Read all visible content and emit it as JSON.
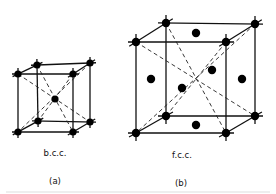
{
  "figures": [
    {
      "id": "a",
      "structure_label": "b.c.c.",
      "panel_label": "(a)",
      "lattice": "body-centered cubic",
      "corners": {
        "ftl": [
          18,
          74
        ],
        "ftr": [
          73,
          74
        ],
        "fbl": [
          18,
          132
        ],
        "fbr": [
          73,
          132
        ],
        "btl": [
          37,
          65
        ],
        "btr": [
          90,
          63
        ],
        "bbl": [
          38,
          121
        ],
        "bbr": [
          90,
          122
        ]
      },
      "center_atom": [
        55,
        99
      ],
      "face_atoms": [],
      "label_pos": [
        55,
        156
      ],
      "panel_pos": [
        55,
        184
      ]
    },
    {
      "id": "b",
      "structure_label": "f.c.c.",
      "panel_label": "(b)",
      "lattice": "face-centered cubic",
      "corners": {
        "ftl": [
          136,
          42
        ],
        "ftr": [
          226,
          42
        ],
        "fbl": [
          136,
          133
        ],
        "fbr": [
          226,
          133
        ],
        "btl": [
          166,
          23
        ],
        "btr": [
          255,
          24
        ],
        "bbl": [
          166,
          116
        ],
        "bbr": [
          255,
          116
        ]
      },
      "center_atom": [
        182,
        88
      ],
      "face_atoms": [
        [
          196,
          33
        ],
        [
          212,
          70
        ],
        [
          151,
          79
        ],
        [
          242,
          79
        ],
        [
          196,
          125
        ]
      ],
      "label_pos": [
        182,
        158
      ],
      "panel_pos": [
        181,
        186
      ]
    }
  ],
  "colors": {
    "ink": "#111111",
    "background": "#ffffff"
  }
}
